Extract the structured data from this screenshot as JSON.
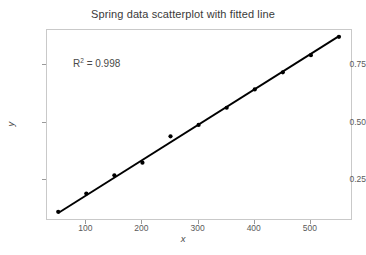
{
  "chart_data": {
    "type": "scatter",
    "title": "Spring data scatterplot with fitted line",
    "xlabel": "x",
    "ylabel": "y",
    "x": [
      50,
      100,
      150,
      200,
      250,
      300,
      350,
      400,
      450,
      500,
      550
    ],
    "values": [
      0.11,
      0.19,
      0.27,
      0.325,
      0.44,
      0.49,
      0.565,
      0.645,
      0.72,
      0.795,
      0.875
    ],
    "series": [
      {
        "name": "Spring data",
        "x": [
          50,
          100,
          150,
          200,
          250,
          300,
          350,
          400,
          450,
          500,
          550
        ],
        "values": [
          0.11,
          0.19,
          0.27,
          0.325,
          0.44,
          0.49,
          0.565,
          0.645,
          0.72,
          0.795,
          0.875
        ]
      },
      {
        "name": "fitted line",
        "x": [
          50,
          550
        ],
        "values": [
          0.105,
          0.878
        ]
      }
    ],
    "xlim": [
      30,
      575
    ],
    "ylim": [
      0.07,
      0.905
    ],
    "xticks": [
      100,
      200,
      300,
      400,
      500
    ],
    "xtick_labels": [
      "100",
      "200",
      "300",
      "400",
      "500"
    ],
    "yticks": [
      0.25,
      0.5,
      0.75
    ],
    "ytick_labels": [
      "0.25",
      "0.50",
      "0.75"
    ],
    "grid": false,
    "legend": "none",
    "annotations": [
      {
        "name": "r-squared",
        "prefix": "R",
        "superscript": "2",
        "suffix": " = 0.998",
        "text": "R2 = 0.998",
        "x": 150,
        "y": 0.8
      }
    ],
    "colors": {
      "marker": "#000000",
      "line": "#000000",
      "frame": "#c9c9c9",
      "text": "#4a4a4a",
      "background": "#ffffff"
    }
  }
}
